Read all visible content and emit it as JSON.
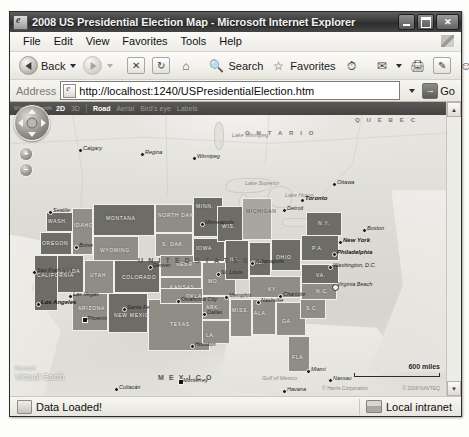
{
  "window": {
    "title": "2008 US Presidential Election Map - Microsoft Internet Explorer",
    "app_icon": "ie-e-icon",
    "minimize": "Minimize",
    "maximize": "Maximize",
    "close": "Close"
  },
  "menu": {
    "items": [
      "File",
      "Edit",
      "View",
      "Favorites",
      "Tools",
      "Help"
    ],
    "flag_icon": "windows-flag-icon"
  },
  "toolbar": {
    "back": "Back",
    "forward": "Forward",
    "stop": "Stop",
    "refresh": "Refresh",
    "home": "Home",
    "search": "Search",
    "favorites": "Favorites",
    "history": "History",
    "mail": "Mail",
    "print": "Print",
    "edit": "Edit",
    "messenger": "Messenger"
  },
  "address": {
    "label": "Address",
    "url": "http://localhost:1240/USPresidentialElection.htm",
    "placeholder": "http://",
    "go": "Go"
  },
  "map": {
    "brand_small": "Microsoft",
    "brand": "Virtual Earth",
    "brand_tm": "™",
    "controls": {
      "two_d": "2D",
      "three_d": "3D",
      "road": "Road",
      "aerial": "Aerial",
      "birdseye": "Bird's eye",
      "labels": "Labels"
    },
    "nav": {
      "pan": "pan-control",
      "zoom_in": "+",
      "zoom_out": "−"
    },
    "scale": "600 miles",
    "credit": "© 2008 NAVTEQ",
    "credit2": "© Harris Corporation",
    "countries": [
      {
        "name": "U N I T E D   S T A T E S",
        "x": 128,
        "y": 155,
        "big": true
      },
      {
        "name": "M E X I C O",
        "x": 148,
        "y": 272,
        "big": true
      },
      {
        "name": "O N T A R I O",
        "x": 235,
        "y": 28,
        "big": false
      },
      {
        "name": "Q U E B E C",
        "x": 345,
        "y": 15,
        "big": false
      }
    ],
    "waters": [
      {
        "name": "Gulf of Mexico",
        "x": 252,
        "y": 273
      },
      {
        "name": "Lake Winnipeg",
        "x": 222,
        "y": 30
      },
      {
        "name": "Lake Superior",
        "x": 235,
        "y": 78
      },
      {
        "name": "Lake Huron",
        "x": 275,
        "y": 90
      }
    ],
    "states": [
      {
        "label": "WASH.",
        "x": 36,
        "y": 110,
        "w": 30,
        "h": 20,
        "tone": "dark",
        "lx": 38,
        "ly": 116
      },
      {
        "label": "OREGON",
        "x": 30,
        "y": 130,
        "w": 32,
        "h": 23,
        "tone": "dark",
        "lx": 32,
        "ly": 138
      },
      {
        "label": "IDAHO",
        "x": 62,
        "y": 106,
        "w": 21,
        "h": 47,
        "tone": "mid",
        "lx": 64,
        "ly": 120
      },
      {
        "label": "MONTANA",
        "x": 83,
        "y": 102,
        "w": 62,
        "h": 32,
        "tone": "dark",
        "lx": 96,
        "ly": 113
      },
      {
        "label": "NORTH DAKOTA",
        "x": 145,
        "y": 102,
        "w": 38,
        "h": 29,
        "tone": "mid",
        "lx": 148,
        "ly": 110
      },
      {
        "label": "MINN.",
        "x": 183,
        "y": 95,
        "w": 30,
        "h": 40,
        "tone": "dark",
        "lx": 186,
        "ly": 101
      },
      {
        "label": "S. DAK.",
        "x": 145,
        "y": 131,
        "w": 38,
        "h": 24,
        "tone": "mid",
        "lx": 152,
        "ly": 139
      },
      {
        "label": "WYOMING",
        "x": 83,
        "y": 134,
        "w": 46,
        "h": 30,
        "tone": "mid",
        "lx": 90,
        "ly": 145
      },
      {
        "label": "NEVADA",
        "x": 44,
        "y": 153,
        "w": 30,
        "h": 38,
        "tone": "dark",
        "lx": 46,
        "ly": 166
      },
      {
        "label": "CALIFORNIA",
        "x": 24,
        "y": 153,
        "w": 24,
        "h": 56,
        "tone": "dark",
        "lx": 27,
        "ly": 170
      },
      {
        "label": "UTAH",
        "x": 74,
        "y": 158,
        "w": 30,
        "h": 38,
        "tone": "mid",
        "lx": 80,
        "ly": 170
      },
      {
        "label": "COLORADO",
        "x": 104,
        "y": 158,
        "w": 46,
        "h": 33,
        "tone": "dark",
        "lx": 112,
        "ly": 172
      },
      {
        "label": "NEBR.",
        "x": 150,
        "y": 153,
        "w": 42,
        "h": 22,
        "tone": "mid",
        "lx": 166,
        "ly": 159
      },
      {
        "label": "KANSAS",
        "x": 150,
        "y": 175,
        "w": 42,
        "h": 22,
        "tone": "mid",
        "lx": 160,
        "ly": 182
      },
      {
        "label": "ARIZONA",
        "x": 62,
        "y": 191,
        "w": 36,
        "h": 38,
        "tone": "mid",
        "lx": 68,
        "ly": 203
      },
      {
        "label": "NEW MEXICO",
        "x": 98,
        "y": 191,
        "w": 40,
        "h": 40,
        "tone": "dark",
        "lx": 104,
        "ly": 210
      },
      {
        "label": "TEXAS",
        "x": 138,
        "y": 197,
        "w": 62,
        "h": 52,
        "tone": "mid",
        "lx": 160,
        "ly": 219
      },
      {
        "label": "OKLA.",
        "x": 150,
        "y": 186,
        "w": 48,
        "h": 16,
        "tone": "mid",
        "lx": 176,
        "ly": 191
      },
      {
        "label": "IOWA",
        "x": 183,
        "y": 136,
        "w": 32,
        "h": 24,
        "tone": "dark",
        "lx": 186,
        "ly": 143
      },
      {
        "label": "MO.",
        "x": 192,
        "y": 160,
        "w": 34,
        "h": 34,
        "tone": "mid",
        "lx": 198,
        "ly": 176
      },
      {
        "label": "ARK.",
        "x": 192,
        "y": 194,
        "w": 28,
        "h": 24,
        "tone": "mid",
        "lx": 196,
        "ly": 202
      },
      {
        "label": "LA.",
        "x": 192,
        "y": 218,
        "w": 28,
        "h": 24,
        "tone": "mid",
        "lx": 196,
        "ly": 230
      },
      {
        "label": "WIS.",
        "x": 207,
        "y": 104,
        "w": 28,
        "h": 36,
        "tone": "dark",
        "lx": 212,
        "ly": 121
      },
      {
        "label": "ILL.",
        "x": 215,
        "y": 138,
        "w": 24,
        "h": 40,
        "tone": "dark",
        "lx": 220,
        "ly": 154
      },
      {
        "label": "MISS.",
        "x": 220,
        "y": 197,
        "w": 22,
        "h": 38,
        "tone": "mid",
        "lx": 222,
        "ly": 205
      },
      {
        "label": "IND.",
        "x": 239,
        "y": 140,
        "w": 22,
        "h": 34,
        "tone": "dark",
        "lx": 242,
        "ly": 157
      },
      {
        "label": "MICHIGAN",
        "x": 232,
        "y": 96,
        "w": 30,
        "h": 42,
        "tone": "light",
        "lx": 236,
        "ly": 106
      },
      {
        "label": "OHIO",
        "x": 261,
        "y": 137,
        "w": 30,
        "h": 32,
        "tone": "dark",
        "lx": 266,
        "ly": 152
      },
      {
        "label": "KY.",
        "x": 239,
        "y": 174,
        "w": 52,
        "h": 22,
        "tone": "mid",
        "lx": 258,
        "ly": 184
      },
      {
        "label": "ALA.",
        "x": 242,
        "y": 197,
        "w": 24,
        "h": 36,
        "tone": "mid",
        "lx": 244,
        "ly": 208
      },
      {
        "label": "GA.",
        "x": 266,
        "y": 200,
        "w": 30,
        "h": 34,
        "tone": "mid",
        "lx": 272,
        "ly": 216
      },
      {
        "label": "FLA.",
        "x": 278,
        "y": 234,
        "w": 22,
        "h": 36,
        "tone": "mid",
        "lx": 282,
        "ly": 252
      },
      {
        "label": "S.C.",
        "x": 290,
        "y": 195,
        "w": 26,
        "h": 22,
        "tone": "mid",
        "lx": 296,
        "ly": 203
      },
      {
        "label": "N.C.",
        "x": 291,
        "y": 180,
        "w": 36,
        "h": 18,
        "tone": "mid",
        "lx": 306,
        "ly": 186
      },
      {
        "label": "VA.",
        "x": 291,
        "y": 162,
        "w": 38,
        "h": 20,
        "tone": "dark",
        "lx": 306,
        "ly": 170
      },
      {
        "label": "P.A.",
        "x": 291,
        "y": 133,
        "w": 38,
        "h": 26,
        "tone": "dark",
        "lx": 302,
        "ly": 143
      },
      {
        "label": "N.Y.",
        "x": 296,
        "y": 110,
        "w": 36,
        "h": 24,
        "tone": "dark",
        "lx": 308,
        "ly": 118
      }
    ],
    "cities": [
      {
        "name": "Calgary",
        "x": 68,
        "y": 44,
        "kind": "dot"
      },
      {
        "name": "Regina",
        "x": 130,
        "y": 48,
        "kind": "dot"
      },
      {
        "name": "Winnipeg",
        "x": 182,
        "y": 52,
        "kind": "dot"
      },
      {
        "name": "Ottawa",
        "x": 322,
        "y": 78,
        "kind": "dot"
      },
      {
        "name": "Toronto",
        "x": 290,
        "y": 94,
        "kind": "bold"
      },
      {
        "name": "Detroit",
        "x": 272,
        "y": 104,
        "kind": "dot"
      },
      {
        "name": "Seattle",
        "x": 38,
        "y": 106,
        "kind": "dot"
      },
      {
        "name": "Boise",
        "x": 64,
        "y": 141,
        "kind": "dot"
      },
      {
        "name": "Minneapolis",
        "x": 190,
        "y": 118,
        "kind": "dot"
      },
      {
        "name": "Denver",
        "x": 138,
        "y": 161,
        "kind": "dot"
      },
      {
        "name": "San Francisco",
        "x": 22,
        "y": 166,
        "kind": "dot"
      },
      {
        "name": "Las Vegas",
        "x": 58,
        "y": 190,
        "kind": "dot"
      },
      {
        "name": "Los Angeles",
        "x": 26,
        "y": 198,
        "kind": "bold"
      },
      {
        "name": "Phoenix",
        "x": 72,
        "y": 214,
        "kind": "sq"
      },
      {
        "name": "Santa Fe",
        "x": 112,
        "y": 203,
        "kind": "dot"
      },
      {
        "name": "Oklahoma City",
        "x": 166,
        "y": 195,
        "kind": "dot"
      },
      {
        "name": "Dallas",
        "x": 192,
        "y": 208,
        "kind": "dot"
      },
      {
        "name": "Houston",
        "x": 180,
        "y": 240,
        "kind": "dot"
      },
      {
        "name": "St. Louis",
        "x": 206,
        "y": 168,
        "kind": "dot"
      },
      {
        "name": "Indianapolis",
        "x": 240,
        "y": 157,
        "kind": "dot"
      },
      {
        "name": "Memphis",
        "x": 214,
        "y": 191,
        "kind": "dot"
      },
      {
        "name": "Nashville",
        "x": 246,
        "y": 196,
        "kind": "dot"
      },
      {
        "name": "Charlotte",
        "x": 268,
        "y": 190,
        "kind": "dot"
      },
      {
        "name": "New York",
        "x": 328,
        "y": 136,
        "kind": "bold"
      },
      {
        "name": "Philadelphia",
        "x": 322,
        "y": 148,
        "kind": "bold"
      },
      {
        "name": "Washington, D.C.",
        "x": 318,
        "y": 161,
        "kind": "dot"
      },
      {
        "name": "Virginia Beach",
        "x": 322,
        "y": 180,
        "kind": "star"
      },
      {
        "name": "Boston",
        "x": 352,
        "y": 124,
        "kind": "dot"
      },
      {
        "name": "Miami",
        "x": 296,
        "y": 265,
        "kind": "dot"
      },
      {
        "name": "Nassau",
        "x": 318,
        "y": 274,
        "kind": "dot"
      },
      {
        "name": "Havana",
        "x": 272,
        "y": 285,
        "kind": "dot"
      },
      {
        "name": "Monterrey",
        "x": 168,
        "y": 276,
        "kind": "sq"
      },
      {
        "name": "Culiacán",
        "x": 104,
        "y": 283,
        "kind": "dot"
      },
      {
        "name": "Mexico City",
        "x": 186,
        "y": 300,
        "kind": "dot"
      }
    ]
  },
  "scrollbar": {
    "up": "▲",
    "down": "▼"
  },
  "status": {
    "message": "Data Loaded!",
    "zone": "Local intranet",
    "zone_icon": "network-zone-icon",
    "status_icon": "page-status-icon"
  }
}
